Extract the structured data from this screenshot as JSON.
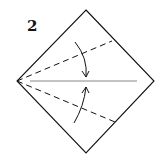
{
  "diagram": {
    "step_number": "2",
    "colors": {
      "line": "#111111",
      "center_line": "#888888",
      "background": "#ffffff"
    }
  }
}
